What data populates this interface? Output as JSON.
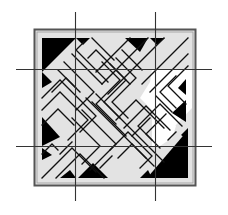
{
  "figure": {
    "type": "maze-tile-diagram",
    "colors": {
      "background": "#ffffff",
      "tile_fill": "#e3e3e3",
      "frame_border": "#555555",
      "maze_line": "#111111",
      "solid_triangle": "#000000",
      "open_region": "#ffffff",
      "guide_line": "#333333"
    },
    "frame": {
      "x": 34,
      "y": 29,
      "size": 162
    },
    "guides": {
      "vertical_x": [
        75,
        155
      ],
      "horizontal_y": [
        69,
        146
      ],
      "v_extent": [
        12,
        201
      ],
      "h_extent": [
        16,
        212
      ]
    },
    "grid": {
      "rows": 3,
      "cols": 3
    }
  }
}
